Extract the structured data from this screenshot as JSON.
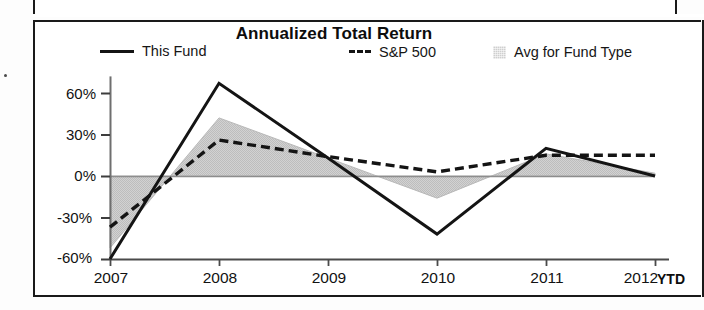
{
  "chart_data": {
    "type": "line",
    "title": "Annualized Total Return",
    "xlabel": "",
    "ylabel": "",
    "categories": [
      "2007",
      "2008",
      "2009",
      "2010",
      "2011",
      "2012"
    ],
    "x_suffix_label": "YTD",
    "ytick_labels": [
      "60%",
      "30%",
      "0%",
      "-30%",
      "-60%"
    ],
    "ytick_values": [
      60,
      30,
      0,
      -30,
      -60
    ],
    "ylim": [
      -60,
      75
    ],
    "grid": false,
    "legend_position": "top",
    "zero_line": true,
    "series": [
      {
        "name": "This Fund",
        "style": "solid",
        "color": "#141414",
        "values": [
          -60,
          67,
          13,
          -42,
          20,
          0
        ]
      },
      {
        "name": "S&P 500",
        "style": "dashed",
        "color": "#141414",
        "values": [
          -37,
          26,
          14,
          3,
          15,
          15
        ]
      },
      {
        "name": "Avg for Fund Type",
        "style": "filled-area",
        "color": "#cfcfcf",
        "values": [
          -52,
          42,
          13,
          -16,
          16,
          2
        ]
      }
    ]
  },
  "legend": {
    "items": [
      {
        "label": "This Fund",
        "marker": "solid-line-swatch"
      },
      {
        "label": "S&P 500",
        "marker": "dashed-line-swatch"
      },
      {
        "label": "Avg for Fund Type",
        "marker": "shaded-box-swatch"
      }
    ]
  },
  "colors": {
    "line": "#141414",
    "area_fill": "#cfcfcf",
    "frame": "#1a1a1a",
    "background": "#ffffff"
  }
}
